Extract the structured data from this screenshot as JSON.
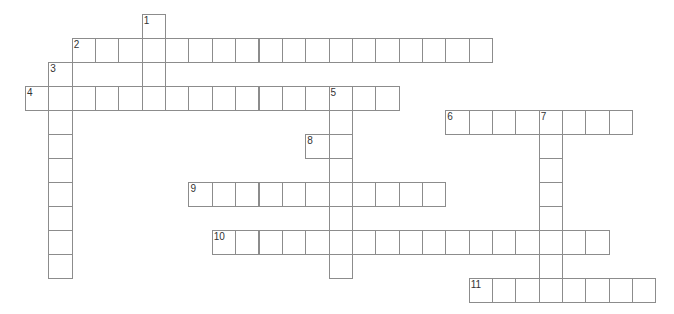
{
  "puzzle": {
    "type": "crossword",
    "layout": {
      "origin_x": 25,
      "origin_y": 14,
      "cell_w": 23.35,
      "cell_h": 24
    },
    "colors": {
      "line": "#8c8c8c",
      "number": "#333333",
      "background": "#ffffff"
    },
    "entries": [
      {
        "number": "1",
        "direction": "down",
        "row": 0,
        "col": 5,
        "length": 4
      },
      {
        "number": "2",
        "direction": "across",
        "row": 1,
        "col": 2,
        "length": 18
      },
      {
        "number": "3",
        "direction": "down",
        "row": 2,
        "col": 1,
        "length": 9
      },
      {
        "number": "4",
        "direction": "across",
        "row": 3,
        "col": 0,
        "length": 16
      },
      {
        "number": "5",
        "direction": "down",
        "row": 3,
        "col": 13,
        "length": 8
      },
      {
        "number": "6",
        "direction": "across",
        "row": 4,
        "col": 18,
        "length": 8
      },
      {
        "number": "7",
        "direction": "down",
        "row": 4,
        "col": 22,
        "length": 8
      },
      {
        "number": "8",
        "direction": "across",
        "row": 5,
        "col": 12,
        "length": 2
      },
      {
        "number": "9",
        "direction": "across",
        "row": 7,
        "col": 7,
        "length": 11
      },
      {
        "number": "10",
        "direction": "across",
        "row": 9,
        "col": 8,
        "length": 17
      },
      {
        "number": "11",
        "direction": "across",
        "row": 11,
        "col": 19,
        "length": 8
      }
    ]
  }
}
